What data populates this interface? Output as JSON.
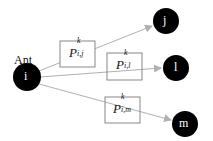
{
  "diagram": {
    "ant_label": "Ant",
    "source_node": {
      "label": "i",
      "x": 27,
      "y": 77
    },
    "targets": [
      {
        "label": "j",
        "x": 166,
        "y": 21,
        "prob": {
          "base": "P",
          "sup": "k",
          "sub": "i,j"
        },
        "box": {
          "x": 60,
          "y": 41
        }
      },
      {
        "label": "l",
        "x": 176,
        "y": 68,
        "prob": {
          "base": "P",
          "sup": "k",
          "sub": "i,l"
        },
        "box": {
          "x": 107,
          "y": 53
        }
      },
      {
        "label": "m",
        "x": 185,
        "y": 124,
        "prob": {
          "base": "P",
          "sup": "k",
          "sub": "i,m"
        },
        "box": {
          "x": 105,
          "y": 97
        }
      }
    ],
    "colors": {
      "node": "#000000",
      "edge": "#b0b0b0",
      "box_border": "#888888"
    }
  }
}
